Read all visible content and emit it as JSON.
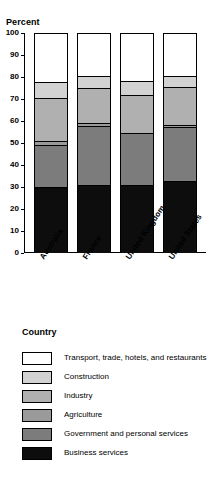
{
  "chart_data": {
    "type": "bar",
    "title": "",
    "ylabel": "Percent",
    "xlabel": "Country",
    "categories": [
      "Australia",
      "France",
      "United Kingdom",
      "United States"
    ],
    "ylim": [
      0,
      100
    ],
    "yticks": [
      0,
      10,
      20,
      30,
      40,
      50,
      60,
      70,
      80,
      90,
      100
    ],
    "grid": false,
    "stacked": true,
    "legend_position": "bottom",
    "series": [
      {
        "name": "Transport, trade, hotels, and restaurants",
        "color": "#ffffff",
        "values": [
          22.0,
          19.0,
          21.5,
          19.0
        ]
      },
      {
        "name": "Construction",
        "color": "#d2d2d2",
        "values": [
          7.0,
          5.5,
          6.5,
          5.0
        ]
      },
      {
        "name": "Industry",
        "color": "#b0b0b0",
        "values": [
          20.0,
          16.0,
          17.0,
          17.5
        ]
      },
      {
        "name": "Agriculture",
        "color": "#9a9a9a",
        "values": [
          1.5,
          1.5,
          0.0,
          1.0
        ]
      },
      {
        "name": "Government and personal services",
        "color": "#7c7c7c",
        "values": [
          19.5,
          27.0,
          24.0,
          24.5
        ]
      },
      {
        "name": "Business services",
        "color": "#0d0d0d",
        "values": [
          30.0,
          31.0,
          31.0,
          33.0
        ]
      }
    ]
  },
  "legend": {
    "title": "Country"
  }
}
